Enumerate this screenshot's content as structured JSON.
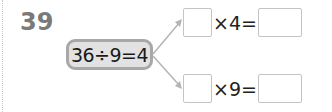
{
  "problem": {
    "number": "39",
    "given_equation": "36÷9=4",
    "branches": [
      {
        "operator_text": "×4=",
        "blank_left": "",
        "blank_right": ""
      },
      {
        "operator_text": "×9=",
        "blank_left": "",
        "blank_right": ""
      }
    ]
  },
  "colors": {
    "box_border": "#a8a8a8",
    "box_fill": "#e2e2e2",
    "arrow": "#b4b4b4",
    "number": "#7a7a7a"
  }
}
